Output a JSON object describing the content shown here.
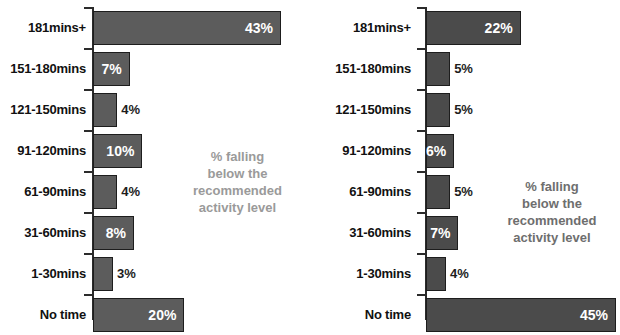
{
  "chart_data": [
    {
      "type": "bar",
      "id": "left-chart",
      "orientation": "horizontal",
      "title": "",
      "xlabel": "",
      "ylabel": "",
      "categories": [
        "181mins+",
        "151-180mins",
        "121-150mins",
        "91-120mins",
        "61-90mins",
        "31-60mins",
        "1-30mins",
        "No time"
      ],
      "values": [
        43,
        7,
        4,
        10,
        4,
        8,
        3,
        20
      ],
      "value_labels": [
        "43%",
        "7%",
        "4%",
        "10%",
        "4%",
        "8%",
        "3%",
        "20%"
      ],
      "label_inside": [
        true,
        true,
        false,
        true,
        false,
        true,
        false,
        true
      ],
      "xlim": [
        0,
        45
      ],
      "grid": false,
      "bar_color": "#5c5c5c",
      "bar_border_color": "#1d1d1d",
      "annotation": "% falling\nbelow the\nrecommended\nactivity level",
      "annotation_color": "#9a9a9a"
    },
    {
      "type": "bar",
      "id": "right-chart",
      "orientation": "horizontal",
      "title": "",
      "xlabel": "",
      "ylabel": "",
      "categories": [
        "181mins+",
        "151-180mins",
        "121-150mins",
        "91-120mins",
        "61-90mins",
        "31-60mins",
        "1-30mins",
        "No time"
      ],
      "values": [
        22,
        5,
        5,
        6,
        5,
        7,
        4,
        45
      ],
      "value_labels": [
        "22%",
        "5%",
        "5%",
        "6%",
        "5%",
        "7%",
        "4%",
        "45%"
      ],
      "label_inside": [
        true,
        false,
        false,
        true,
        false,
        true,
        false,
        true
      ],
      "xlim": [
        0,
        45
      ],
      "grid": false,
      "bar_color": "#4b4b4b",
      "bar_border_color": "#1d1d1d",
      "annotation": "% falling\nbelow the\nrecommended\nactivity level",
      "annotation_color": "#6e6e6e"
    }
  ]
}
